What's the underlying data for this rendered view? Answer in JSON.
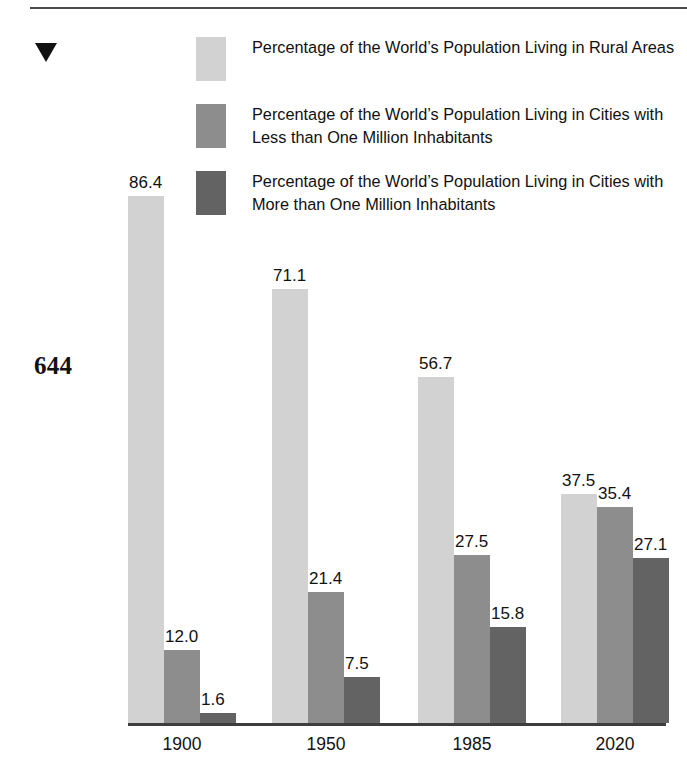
{
  "page": {
    "page_number": "644",
    "marker_icon": "down-triangle-icon"
  },
  "legend": {
    "items": [
      {
        "label": "Percentage of the World’s Population Living in Rural Areas",
        "color": "#d2d2d2",
        "swatch_icon": "legend-swatch-rural"
      },
      {
        "label": "Percentage of the World’s Population Living in Cities with Less than One Million Inhabitants",
        "color": "#8d8d8d",
        "swatch_icon": "legend-swatch-small-cities"
      },
      {
        "label": "Percentage of the World’s Population Living in Cities with More than One Million Inhabitants",
        "color": "#636363",
        "swatch_icon": "legend-swatch-large-cities"
      }
    ]
  },
  "chart_data": {
    "type": "bar",
    "title": "",
    "xlabel": "",
    "ylabel": "",
    "ylim": [
      0,
      86.4
    ],
    "grid": false,
    "legend_position": "top",
    "categories": [
      "1900",
      "1950",
      "1985",
      "2020"
    ],
    "series": [
      {
        "name": "Percentage of the World’s Population Living in Rural Areas",
        "color": "#d2d2d2",
        "values": [
          86.4,
          71.1,
          56.7,
          37.5
        ],
        "labels": [
          "86.4",
          "71.1",
          "56.7",
          "37.5"
        ]
      },
      {
        "name": "Percentage of the World’s Population Living in Cities with Less than One Million Inhabitants",
        "color": "#8d8d8d",
        "values": [
          12.0,
          21.4,
          27.5,
          35.4
        ],
        "labels": [
          "12.0",
          "21.4",
          "27.5",
          "35.4"
        ]
      },
      {
        "name": "Percentage of the World’s Population Living in Cities with More than One Million Inhabitants",
        "color": "#636363",
        "values": [
          1.6,
          7.5,
          15.8,
          27.1
        ],
        "labels": [
          "1.6",
          "7.5",
          "15.8",
          "27.1"
        ]
      }
    ]
  },
  "layout": {
    "baseline_y": 723,
    "pixels_per_unit": 6.1,
    "bar_width": 36,
    "group_left": [
      128,
      272,
      418,
      561
    ]
  }
}
